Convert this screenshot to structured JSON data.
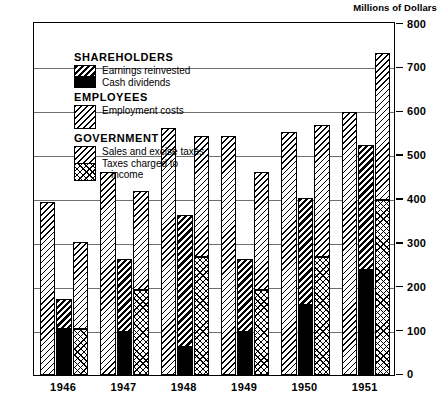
{
  "unit_title": "Millions of Dollars",
  "legend": {
    "groups": [
      {
        "heading": "SHAREHOLDERS",
        "swatch_kind": "stack-earnings-dividends",
        "items": [
          {
            "label": "Earnings reinvested",
            "swatch": "pat-earnings"
          },
          {
            "label": "Cash dividends",
            "swatch": "pat-dividends"
          }
        ]
      },
      {
        "heading": "EMPLOYEES",
        "swatch_kind": "single-employment",
        "items": [
          {
            "label": "Employment costs",
            "swatch": "pat-employment"
          }
        ]
      },
      {
        "heading": "GOVERNMENT",
        "swatch_kind": "stack-sales-income",
        "items": [
          {
            "label": "Sales and excise taxes",
            "swatch": "pat-sales"
          },
          {
            "label": "Taxes charged to",
            "label2": "income",
            "swatch": "pat-income"
          }
        ]
      }
    ]
  },
  "chart_data": {
    "type": "bar",
    "title": "",
    "subtitle": "",
    "xlabel": "",
    "ylabel": "Millions of Dollars",
    "ylim": [
      0,
      800
    ],
    "ytick_labels": [
      "800",
      "700",
      "600",
      "500",
      "400",
      "300",
      "200",
      "100",
      "0"
    ],
    "ytick_values": [
      800,
      700,
      600,
      500,
      400,
      300,
      200,
      100,
      0
    ],
    "grid": true,
    "grid_at": [
      700,
      600,
      500,
      400,
      300,
      200,
      100
    ],
    "legend_position": "inside-top-left",
    "categories": [
      "1946",
      "1947",
      "1948",
      "1949",
      "1950",
      "1951"
    ],
    "bar_groups": [
      {
        "name": "Employment costs",
        "stacked": false,
        "fill": "pat-employment",
        "values": [
          395,
          465,
          565,
          545,
          555,
          600
        ]
      },
      {
        "name": "Shareholders",
        "stacked": true,
        "segments": [
          {
            "name": "Cash dividends",
            "fill": "pat-dividends",
            "values": [
              105,
              100,
              65,
              100,
              160,
              240
            ]
          },
          {
            "name": "Earnings reinvested",
            "fill": "pat-earnings",
            "values": [
              70,
              165,
              300,
              165,
              245,
              285
            ]
          }
        ],
        "totals": [
          175,
          265,
          365,
          265,
          405,
          525
        ]
      },
      {
        "name": "Government",
        "stacked": true,
        "segments": [
          {
            "name": "Taxes charged to income",
            "fill": "pat-income",
            "values": [
              105,
              195,
              270,
              195,
              270,
              400
            ]
          },
          {
            "name": "Sales and excise taxes",
            "fill": "pat-sales",
            "values": [
              200,
              225,
              275,
              270,
              300,
              335
            ]
          }
        ],
        "totals": [
          305,
          420,
          545,
          465,
          570,
          735
        ]
      }
    ]
  },
  "colors": {
    "frame": "#000000",
    "grid": "#6e6e6e",
    "background": "#ffffff",
    "ink": "#000000"
  }
}
